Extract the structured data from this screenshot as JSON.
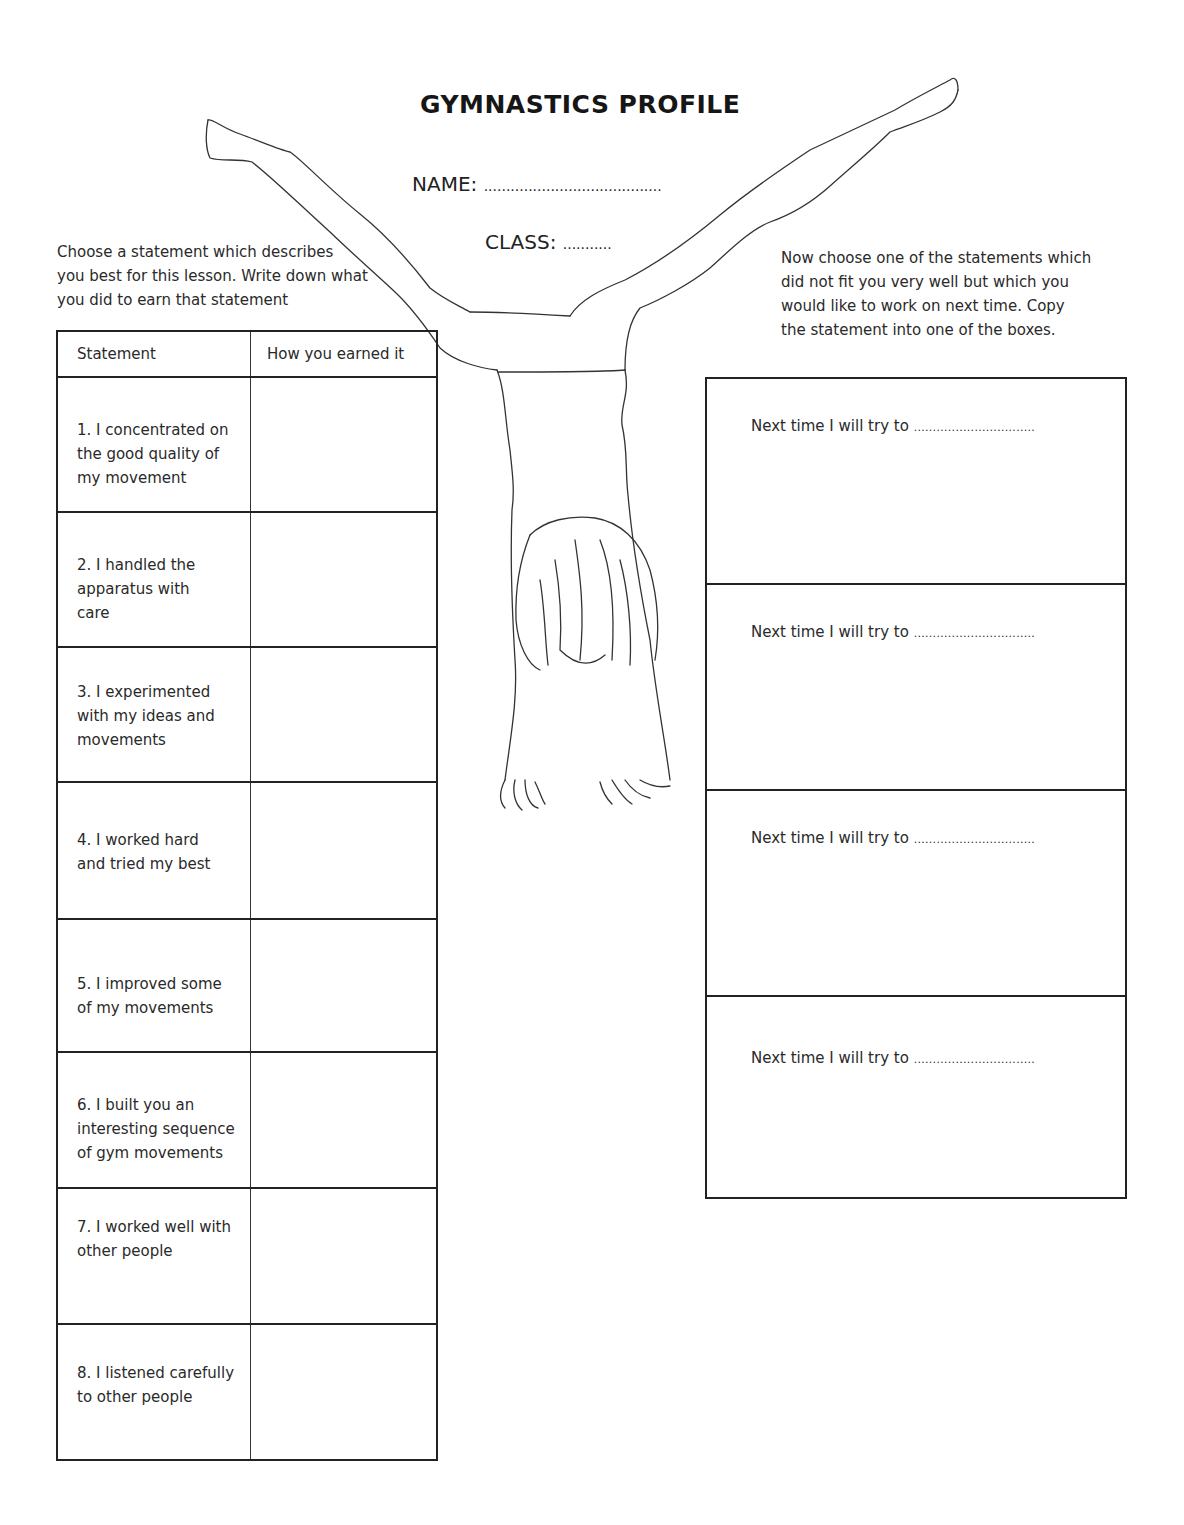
{
  "header": {
    "title": "GYMNASTICS PROFILE",
    "name_label": "NAME:",
    "name_blank": "........................................",
    "class_label": "CLASS:",
    "class_blank": "..........."
  },
  "left_section": {
    "instructions": [
      "Choose a statement which describes",
      "you best for this lesson. Write down what",
      "you did to earn that statement"
    ],
    "table": {
      "columns": [
        "Statement",
        "How you earned it"
      ],
      "rows": [
        {
          "lines": [
            "1. I concentrated on",
            "the good quality of",
            "my movement"
          ],
          "earned": ""
        },
        {
          "lines": [
            "2.  I handled the",
            "apparatus with",
            "care"
          ],
          "earned": ""
        },
        {
          "lines": [
            "3. I experimented",
            "with my ideas and",
            "movements"
          ],
          "earned": ""
        },
        {
          "lines": [
            "4. I worked hard",
            "and tried my best"
          ],
          "earned": ""
        },
        {
          "lines": [
            "5. I improved some",
            "of my movements"
          ],
          "earned": ""
        },
        {
          "lines": [
            "6. I built you an",
            "interesting sequence",
            "of gym movements"
          ],
          "earned": ""
        },
        {
          "lines": [
            "7. I worked well with",
            "other people"
          ],
          "earned": ""
        },
        {
          "lines": [
            "8. I listened carefully",
            "to other people"
          ],
          "earned": ""
        }
      ]
    }
  },
  "right_section": {
    "instructions": [
      "Now choose one of the statements which",
      "did not fit you very well but which you",
      "would like to work on next time. Copy",
      "the statement into one of the boxes."
    ],
    "boxes": [
      {
        "prompt": "Next time I will try to",
        "blank": "................................"
      },
      {
        "prompt": "Next time I will try to",
        "blank": "................................"
      },
      {
        "prompt": "Next time I will try to",
        "blank": "................................"
      },
      {
        "prompt": "Next time I will try to",
        "blank": "................................"
      }
    ]
  },
  "illustration": {
    "icon": "handstand-gymnast-illustration"
  }
}
